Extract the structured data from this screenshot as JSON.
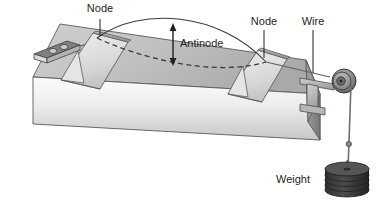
{
  "figure": {
    "background_color": "#ffffff",
    "width": 376,
    "height": 209
  },
  "labels": {
    "node_left": "Node",
    "node_right": "Node",
    "antinode": "Antinode",
    "wire": "Wire",
    "weight": "Weight"
  },
  "colors": {
    "ink": "#231f20",
    "table_top": "#b9babb",
    "table_front_light": "#f2f2f2",
    "table_front_dark": "#c9cacb",
    "table_side": "#8f9092",
    "bridge_light": "#e9e9ea",
    "bridge_mid": "#c2c3c4",
    "bridge_dark": "#a2a3a5",
    "oscillator": "#6e7073",
    "pulley_dark": "#4c4d4f",
    "pulley_mid": "#8b8c8e",
    "weight_dark": "#3a3b3d",
    "weight_mid": "#58595b",
    "wire_color": "#6d6e70"
  },
  "components": {
    "table": "laboratory table drawn in 3d perspective",
    "oscillator": "small vibrator box with two dials on the table top at left",
    "bridge_left": "triangular wedge bridge at left node",
    "bridge_right": "triangular wedge bridge at right node",
    "pulley": "pulley on T-shaped clamp at right table edge",
    "wire": "wire stretched between bridges over the pulley",
    "weight_stack": "stack of 5 slotted disc weights hanging from wire",
    "standing_wave": "single loop standing wave, solid crest curve and dashed trough curve",
    "antinode_arrow": "double headed vertical arrow between crest and trough"
  },
  "wave": {
    "loops": 1,
    "node_count": 2,
    "antinode_count": 1,
    "crest_style": "solid",
    "trough_style": "dashed"
  }
}
